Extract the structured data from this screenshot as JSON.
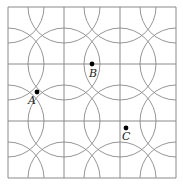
{
  "diagram": {
    "grid": {
      "x0": 8,
      "y0": 7,
      "cols": 3,
      "rows": 3,
      "cell_w": 56,
      "cell_h": 57,
      "line_color": "#8a8a8a"
    },
    "circles": {
      "centered_at": "every grid vertex",
      "radius": 36,
      "stroke_color": "#8a8a8a"
    },
    "points": [
      {
        "label": "A",
        "x": 37,
        "y": 92,
        "label_x": 28,
        "label_y": 104
      },
      {
        "label": "B",
        "x": 92,
        "y": 64,
        "label_x": 89,
        "label_y": 77
      },
      {
        "label": "C",
        "x": 126,
        "y": 128,
        "label_x": 122,
        "label_y": 140
      }
    ]
  }
}
